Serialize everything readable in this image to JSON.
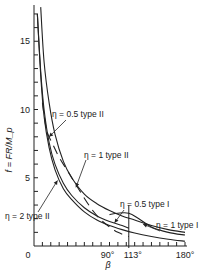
{
  "chart_data": {
    "type": "line",
    "title": "",
    "xlabel": "β",
    "ylabel": "f = FR/M_p",
    "xlim": [
      0,
      180
    ],
    "ylim": [
      0,
      18
    ],
    "x_tick_labels": [
      {
        "value": 0,
        "label": "0"
      },
      {
        "value": 90,
        "label": "90°"
      },
      {
        "value": 113,
        "label": "113°"
      },
      {
        "value": 180,
        "label": "180°"
      }
    ],
    "y_tick_labels": [
      {
        "value": 5,
        "label": "5"
      },
      {
        "value": 10,
        "label": "10"
      },
      {
        "value": 15,
        "label": "15"
      }
    ],
    "x_minor_ticks": [
      10,
      20,
      30,
      40,
      50,
      60,
      70,
      80,
      90,
      100,
      110,
      120,
      130,
      140,
      150,
      160,
      170,
      180
    ],
    "y_minor_ticks": [
      1,
      2,
      3,
      4,
      5,
      6,
      7,
      8,
      9,
      10,
      11,
      12,
      13,
      14,
      15,
      16,
      17
    ],
    "reference_line": {
      "x": 113,
      "label": "113°"
    },
    "grid": false,
    "legend": "none (inline annotations)",
    "series": [
      {
        "name": "η = 2 type II",
        "style": "solid",
        "x": [
          4,
          8,
          12,
          18,
          25,
          35,
          45,
          60,
          75,
          90,
          105,
          120,
          140,
          160,
          180
        ],
        "y": [
          17.0,
          12.5,
          9.5,
          7.2,
          5.6,
          4.2,
          3.4,
          2.5,
          1.9,
          1.5,
          1.2,
          0.95,
          0.7,
          0.5,
          0.35
        ]
      },
      {
        "name": "η = 1 type II",
        "style": "solid",
        "x": [
          4,
          8,
          12,
          18,
          25,
          35,
          45,
          60,
          75,
          90,
          105,
          113
        ],
        "y": [
          17.0,
          12.8,
          10.0,
          7.6,
          6.0,
          4.6,
          3.7,
          2.8,
          2.2,
          1.8,
          1.5,
          1.3
        ]
      },
      {
        "name": "η = 0.5 type II",
        "style": "dashed",
        "x": [
          10,
          15,
          22,
          30,
          40,
          50,
          60,
          70,
          80,
          90,
          100,
          113
        ],
        "y": [
          10.5,
          8.5,
          7.5,
          6.5,
          5.5,
          4.5,
          3.5,
          2.6,
          1.9,
          1.4,
          1.0,
          0.7
        ]
      },
      {
        "name": "η = 0.5 type I",
        "style": "solid",
        "x": [
          90,
          100,
          113,
          125,
          140,
          160,
          180
        ],
        "y": [
          2.3,
          2.4,
          2.4,
          2.0,
          1.4,
          1.0,
          0.8
        ]
      },
      {
        "name": "η = 1 type I",
        "style": "solid",
        "x": [
          8,
          12,
          18,
          25,
          35,
          45,
          60,
          75,
          90,
          105,
          120,
          140,
          160,
          180
        ],
        "y": [
          17.5,
          13.5,
          10.5,
          8.2,
          6.2,
          5.0,
          3.8,
          3.1,
          2.6,
          2.2,
          1.9,
          1.5,
          1.2,
          1.0
        ]
      }
    ],
    "annotations": [
      {
        "text": "η = 0.5 type II",
        "points_to_x": 18,
        "points_to_y": 8.0
      },
      {
        "text": "η = 1 type II",
        "points_to_x": 50,
        "points_to_y": 4.3
      },
      {
        "text": "η = 2 type II",
        "points_to_x": 28,
        "points_to_y": 4.8
      },
      {
        "text": "η = 0.5 type I",
        "points_to_x": 96,
        "points_to_y": 1.7
      },
      {
        "text": "η = 1 type I",
        "points_to_x": 130,
        "points_to_y": 1.6
      }
    ]
  }
}
